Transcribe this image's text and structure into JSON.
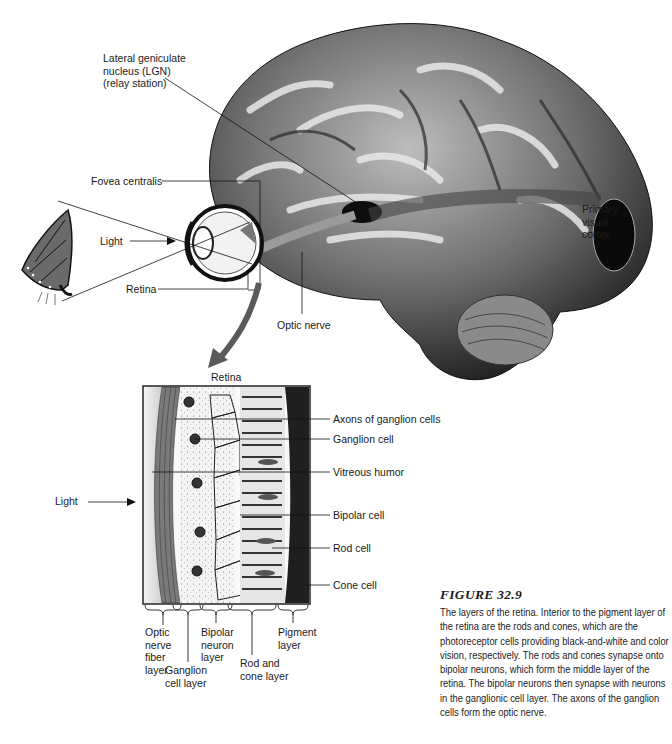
{
  "brain_labels": {
    "lgn": "Lateral geniculate\nnucleus (LGN)\n(relay station)",
    "fovea": "Fovea centralis",
    "light": "Light",
    "retina": "Retina",
    "optic_nerve": "Optic nerve",
    "primary_visual_cortex": "Primary\nvisual\ncortex"
  },
  "retina_section": {
    "title": "Retina",
    "light": "Light",
    "right_labels": [
      "Axons of ganglion cells",
      "Ganglion cell",
      "Vitreous humor",
      "Bipolar cell",
      "Rod cell",
      "Cone cell"
    ],
    "bottom_labels": [
      "Optic\nnerve\nfiber\nlayer",
      "Ganglion\ncell layer",
      "Bipolar\nneuron\nlayer",
      "Rod and\ncone layer",
      "Pigment\nlayer"
    ]
  },
  "caption": {
    "title": "FIGURE 32.9",
    "body": "The layers of the retina. Interior to the pigment layer of the retina are the rods and cones, which are the photoreceptor cells providing black-and-white and color vision, respectively. The rods and cones synapse onto bipolar neurons, which form the middle layer of the retina. The bipolar neurons then synapse with neurons in the ganglionic cell layer. The axons of the ganglion cells form the optic nerve."
  },
  "colors": {
    "background": "#ffffff",
    "ink": "#1a1a1a",
    "brain_dark": "#1c1c1c",
    "brain_light": "#d8d8d8",
    "arrow": "#555555"
  }
}
